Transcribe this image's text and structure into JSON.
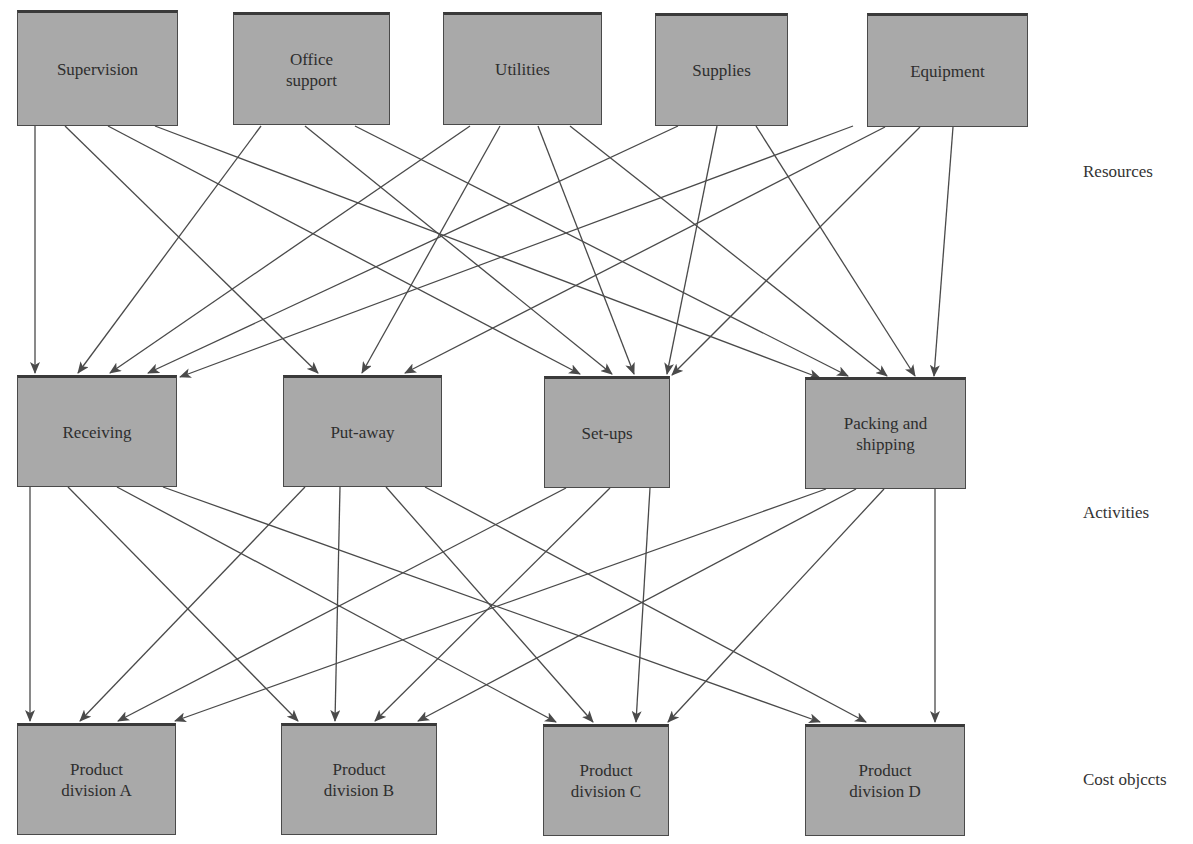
{
  "diagram": {
    "title": "",
    "colors": {
      "box_fill": "#a9a9a9",
      "box_border": "#4a4a4a",
      "line": "#4a4a4a",
      "background": "#ffffff"
    },
    "row_labels": {
      "resources": "Resources",
      "activities": "Activities",
      "cost_objects": "Cost objccts"
    },
    "resources": [
      {
        "id": "supervision",
        "label": "Supervision",
        "x": 17,
        "y": 10,
        "w": 161,
        "h": 116
      },
      {
        "id": "office",
        "label": "Office\nsupport",
        "x": 233,
        "y": 12,
        "w": 157,
        "h": 113
      },
      {
        "id": "utilities",
        "label": "Utilities",
        "x": 443,
        "y": 12,
        "w": 159,
        "h": 113
      },
      {
        "id": "supplies",
        "label": "Supplies",
        "x": 655,
        "y": 13,
        "w": 133,
        "h": 113
      },
      {
        "id": "equipment",
        "label": "Equipment",
        "x": 867,
        "y": 13,
        "w": 161,
        "h": 114
      }
    ],
    "activities": [
      {
        "id": "receiving",
        "label": "Receiving",
        "x": 17,
        "y": 375,
        "w": 160,
        "h": 112
      },
      {
        "id": "putaway",
        "label": "Put-away",
        "x": 283,
        "y": 375,
        "w": 159,
        "h": 112
      },
      {
        "id": "setups",
        "label": "Set-ups",
        "x": 544,
        "y": 376,
        "w": 126,
        "h": 112
      },
      {
        "id": "packing",
        "label": "Packing and\nshipping",
        "x": 805,
        "y": 377,
        "w": 161,
        "h": 112
      }
    ],
    "cost_objects": [
      {
        "id": "divA",
        "label": "Product\ndivision A",
        "x": 17,
        "y": 723,
        "w": 159,
        "h": 112
      },
      {
        "id": "divB",
        "label": "Product\ndivision B",
        "x": 281,
        "y": 723,
        "w": 156,
        "h": 112
      },
      {
        "id": "divC",
        "label": "Product\ndivision C",
        "x": 543,
        "y": 724,
        "w": 126,
        "h": 112
      },
      {
        "id": "divD",
        "label": "Product\ndivision D",
        "x": 805,
        "y": 724,
        "w": 160,
        "h": 112
      }
    ],
    "edges": [
      {
        "from": "supervision",
        "to": "receiving",
        "x1": 35,
        "y1": 126,
        "x2": 35,
        "y2": 373
      },
      {
        "from": "supervision",
        "to": "putaway",
        "x1": 65,
        "y1": 126,
        "x2": 318,
        "y2": 373
      },
      {
        "from": "supervision",
        "to": "setups",
        "x1": 108,
        "y1": 126,
        "x2": 580,
        "y2": 374
      },
      {
        "from": "supervision",
        "to": "packing",
        "x1": 155,
        "y1": 126,
        "x2": 820,
        "y2": 378
      },
      {
        "from": "office",
        "to": "receiving",
        "x1": 261,
        "y1": 126,
        "x2": 78,
        "y2": 373
      },
      {
        "from": "office",
        "to": "setups",
        "x1": 305,
        "y1": 126,
        "x2": 612,
        "y2": 374
      },
      {
        "from": "office",
        "to": "packing",
        "x1": 355,
        "y1": 126,
        "x2": 848,
        "y2": 376
      },
      {
        "from": "utilities",
        "to": "receiving",
        "x1": 470,
        "y1": 126,
        "x2": 110,
        "y2": 373
      },
      {
        "from": "utilities",
        "to": "putaway",
        "x1": 500,
        "y1": 126,
        "x2": 362,
        "y2": 373
      },
      {
        "from": "utilities",
        "to": "setups",
        "x1": 538,
        "y1": 126,
        "x2": 634,
        "y2": 374
      },
      {
        "from": "utilities",
        "to": "packing",
        "x1": 570,
        "y1": 126,
        "x2": 887,
        "y2": 376
      },
      {
        "from": "supplies",
        "to": "receiving",
        "x1": 678,
        "y1": 126,
        "x2": 148,
        "y2": 373
      },
      {
        "from": "supplies",
        "to": "setups",
        "x1": 717,
        "y1": 126,
        "x2": 667,
        "y2": 374
      },
      {
        "from": "supplies",
        "to": "packing",
        "x1": 756,
        "y1": 126,
        "x2": 915,
        "y2": 376
      },
      {
        "from": "equipment",
        "to": "receiving",
        "x1": 853,
        "y1": 126,
        "x2": 180,
        "y2": 377
      },
      {
        "from": "equipment",
        "to": "putaway",
        "x1": 885,
        "y1": 127,
        "x2": 405,
        "y2": 373
      },
      {
        "from": "equipment",
        "to": "setups",
        "x1": 920,
        "y1": 127,
        "x2": 672,
        "y2": 375
      },
      {
        "from": "equipment",
        "to": "packing",
        "x1": 953,
        "y1": 127,
        "x2": 934,
        "y2": 376
      },
      {
        "from": "receiving",
        "to": "divA",
        "x1": 30,
        "y1": 487,
        "x2": 30,
        "y2": 721
      },
      {
        "from": "receiving",
        "to": "divB",
        "x1": 68,
        "y1": 487,
        "x2": 298,
        "y2": 721
      },
      {
        "from": "receiving",
        "to": "divC",
        "x1": 117,
        "y1": 487,
        "x2": 556,
        "y2": 722
      },
      {
        "from": "receiving",
        "to": "divD",
        "x1": 163,
        "y1": 487,
        "x2": 820,
        "y2": 722
      },
      {
        "from": "putaway",
        "to": "divA",
        "x1": 305,
        "y1": 487,
        "x2": 80,
        "y2": 721
      },
      {
        "from": "putaway",
        "to": "divB",
        "x1": 340,
        "y1": 487,
        "x2": 335,
        "y2": 721
      },
      {
        "from": "putaway",
        "to": "divC",
        "x1": 386,
        "y1": 487,
        "x2": 593,
        "y2": 722
      },
      {
        "from": "putaway",
        "to": "divD",
        "x1": 425,
        "y1": 487,
        "x2": 866,
        "y2": 722
      },
      {
        "from": "setups",
        "to": "divA",
        "x1": 566,
        "y1": 488,
        "x2": 118,
        "y2": 721
      },
      {
        "from": "setups",
        "to": "divB",
        "x1": 610,
        "y1": 488,
        "x2": 375,
        "y2": 721
      },
      {
        "from": "setups",
        "to": "divC",
        "x1": 650,
        "y1": 488,
        "x2": 636,
        "y2": 722
      },
      {
        "from": "setups",
        "to": "divD",
        "x1": 565,
        "y1": 488,
        "x2": 565,
        "y2": 488
      },
      {
        "from": "packing",
        "to": "divA",
        "x1": 826,
        "y1": 489,
        "x2": 175,
        "y2": 721
      },
      {
        "from": "packing",
        "to": "divB",
        "x1": 856,
        "y1": 489,
        "x2": 418,
        "y2": 721
      },
      {
        "from": "packing",
        "to": "divC",
        "x1": 884,
        "y1": 489,
        "x2": 668,
        "y2": 722
      },
      {
        "from": "packing",
        "to": "divD",
        "x1": 935,
        "y1": 489,
        "x2": 935,
        "y2": 722
      }
    ]
  }
}
